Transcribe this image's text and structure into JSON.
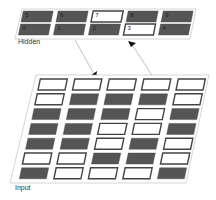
{
  "colors": {
    "panel_fill": "#ffffff",
    "panel_stroke": "#bbbbbb",
    "cell_on": "#ffffff",
    "cell_off": "#555555",
    "cell_border": "#444444",
    "connector": "#999999",
    "arrowhead": "#111111"
  },
  "hidden_layer": {
    "label": "Hidden",
    "rows": [
      [
        {
          "num": "5",
          "active": false
        },
        {
          "num": "6",
          "active": false
        },
        {
          "num": "7",
          "active": true
        },
        {
          "num": "8",
          "active": false
        },
        {
          "num": "9",
          "active": false
        }
      ],
      [
        {
          "num": "0",
          "active": false
        },
        {
          "num": "1",
          "active": false
        },
        {
          "num": "2",
          "active": false
        },
        {
          "num": "3",
          "active": true
        },
        {
          "num": "4",
          "active": false
        }
      ]
    ]
  },
  "input_layer": {
    "label": "Input",
    "rows": [
      [
        1,
        1,
        1,
        1,
        1
      ],
      [
        1,
        0,
        0,
        0,
        1
      ],
      [
        0,
        0,
        0,
        1,
        0
      ],
      [
        0,
        0,
        1,
        1,
        0
      ],
      [
        0,
        0,
        1,
        0,
        1
      ],
      [
        1,
        1,
        0,
        0,
        1
      ],
      [
        0,
        1,
        1,
        1,
        0
      ]
    ]
  },
  "connections": [
    {
      "from": "hidden",
      "to": "input",
      "description": "hidden-to-input"
    },
    {
      "from": "input",
      "to": "hidden",
      "description": "input-to-hidden cell 3"
    }
  ]
}
